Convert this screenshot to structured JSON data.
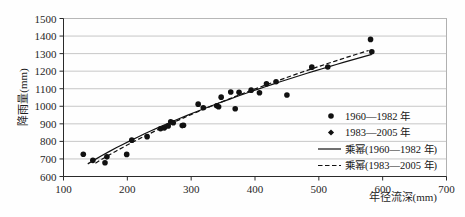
{
  "chart_data": {
    "type": "scatter",
    "title": "",
    "xlabel": "年径流深(mm)",
    "ylabel": "降雨量(mm)",
    "xlim": [
      100,
      700
    ],
    "ylim": [
      600,
      1500
    ],
    "xticks": [
      100,
      200,
      300,
      400,
      500,
      600,
      700
    ],
    "yticks": [
      600,
      700,
      800,
      900,
      1000,
      1100,
      1200,
      1300,
      1400,
      1500
    ],
    "xtick_labels": [
      "100",
      "200",
      "300",
      "400",
      "500",
      "600",
      "700"
    ],
    "ytick_labels": [
      "600",
      "700",
      "800",
      "900",
      "1000",
      "1100",
      "1200",
      "1300",
      "1400",
      "1500"
    ],
    "grid": "horizontal",
    "legend_position": "inside-right-lower",
    "series": [
      {
        "name": "1960—1982 年",
        "marker": "circle",
        "color": "#111111",
        "points": [
          [
            131,
            727
          ],
          [
            146,
            692
          ],
          [
            165,
            678
          ],
          [
            168,
            712
          ],
          [
            199,
            726
          ],
          [
            207,
            807
          ],
          [
            231,
            827
          ],
          [
            252,
            872
          ],
          [
            258,
            877
          ],
          [
            264,
            888
          ],
          [
            268,
            912
          ],
          [
            272,
            906
          ],
          [
            286,
            890
          ],
          [
            288,
            892
          ],
          [
            311,
            1012
          ],
          [
            319,
            992
          ],
          [
            340,
            1003
          ],
          [
            343,
            997
          ],
          [
            347,
            1052
          ],
          [
            362,
            1081
          ],
          [
            369,
            986
          ],
          [
            375,
            1080
          ],
          [
            394,
            1092
          ],
          [
            407,
            1077
          ],
          [
            418,
            1128
          ],
          [
            433,
            1140
          ],
          [
            450,
            1064
          ],
          [
            489,
            1223
          ],
          [
            514,
            1224
          ],
          [
            581,
            1381
          ],
          [
            583,
            1311
          ]
        ]
      },
      {
        "name": "1983—2005 年",
        "marker": "diamond",
        "color": "#111111",
        "points": [
          [
            164,
            764
          ],
          [
            171,
            723
          ],
          [
            182,
            740
          ],
          [
            206,
            806
          ],
          [
            236,
            770
          ],
          [
            247,
            858
          ],
          [
            255,
            874
          ],
          [
            262,
            884
          ],
          [
            266,
            911
          ],
          [
            271,
            913
          ],
          [
            282,
            906
          ],
          [
            291,
            895
          ],
          [
            308,
            1018
          ],
          [
            313,
            1004
          ],
          [
            318,
            927
          ],
          [
            342,
            1000
          ],
          [
            345,
            989
          ],
          [
            359,
            1078
          ],
          [
            368,
            1145
          ],
          [
            376,
            1079
          ],
          [
            396,
            1094
          ],
          [
            419,
            1126
          ],
          [
            524,
            1278
          ],
          [
            554,
            1303
          ]
        ]
      }
    ],
    "trendlines": [
      {
        "name": "乘幂(1960—1982 年)",
        "style": "solid",
        "color": "#111111",
        "x_start": 138,
        "x_end": 583,
        "y_start": 672,
        "y_end": 1296
      },
      {
        "name": "乘幂(1983—2005 年)",
        "style": "dashed",
        "color": "#111111",
        "x_start": 150,
        "x_end": 578,
        "y_start": 676,
        "y_end": 1318
      }
    ],
    "legend_entries": [
      {
        "label": "1960—1982 年",
        "type": "marker",
        "marker": "circle"
      },
      {
        "label": "1983—2005 年",
        "type": "marker",
        "marker": "diamond"
      },
      {
        "label": "乘幂(1960—1982 年)",
        "type": "line",
        "style": "solid"
      },
      {
        "label": "乘幂(1983—2005 年)",
        "type": "line",
        "style": "dashed"
      }
    ]
  }
}
